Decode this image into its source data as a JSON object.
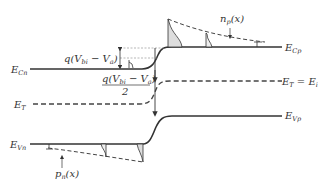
{
  "diagram": {
    "type": "pn-junction-energy-band-diagram",
    "labels": {
      "ecn": {
        "base": "E",
        "sub": "Cn"
      },
      "ecp": {
        "base": "E",
        "sub": "Cp"
      },
      "et_left": {
        "base": "E",
        "sub": "T"
      },
      "et_right": {
        "base": "E",
        "sub": "T",
        "tail": " = E",
        "tail_sub": "i"
      },
      "evn": {
        "base": "E",
        "sub": "Vn"
      },
      "evp": {
        "base": "E",
        "sub": "Vp"
      },
      "np": "n",
      "np_sub": "p",
      "np_arg": "(x)",
      "pn": "p",
      "pn_sub": "n",
      "pn_arg": "(x)",
      "barrier_top": "q(V",
      "barrier_top_sub": "bi",
      "barrier_top_rest": " − V",
      "barrier_top_sub2": "a",
      "barrier_top_close": ")",
      "half_barrier_num": "q(V",
      "half_barrier_sub": "bi",
      "half_barrier_rest": " − V",
      "half_barrier_sub2": "a",
      "half_barrier_close": ")",
      "half_barrier_den": "2"
    },
    "colors": {
      "line": "#333333",
      "fill": "#d9d9d9",
      "dash": "#444444"
    }
  }
}
